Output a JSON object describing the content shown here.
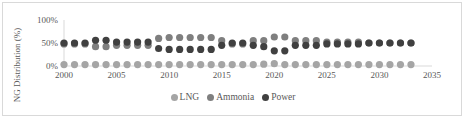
{
  "chart_data": {
    "type": "scatter",
    "title": "",
    "xlabel": "",
    "ylabel": "NG Distribution (%)",
    "xlim": [
      2000,
      2035
    ],
    "ylim": [
      0,
      100
    ],
    "x_ticks": [
      "2000",
      "2005",
      "2010",
      "2015",
      "2020",
      "2025",
      "2030",
      "2035"
    ],
    "y_ticks": [
      "0%",
      "50%",
      "100%"
    ],
    "grid": false,
    "legend_position": "bottom",
    "x": [
      2000,
      2001,
      2002,
      2003,
      2004,
      2005,
      2006,
      2007,
      2008,
      2009,
      2010,
      2011,
      2012,
      2013,
      2014,
      2015,
      2016,
      2017,
      2018,
      2019,
      2020,
      2021,
      2022,
      2023,
      2024,
      2025,
      2026,
      2027,
      2028,
      2029,
      2030,
      2031,
      2032,
      2033
    ],
    "series": [
      {
        "name": "LNG",
        "color": "#a5a5a5",
        "values": [
          3,
          3,
          3,
          3,
          3,
          3,
          3,
          3,
          3,
          3,
          3,
          3,
          3,
          3,
          3,
          3,
          3,
          3,
          3,
          4,
          5,
          3,
          3,
          3,
          3,
          3,
          3,
          3,
          3,
          3,
          3,
          3,
          3,
          3
        ]
      },
      {
        "name": "Ammonia",
        "color": "#7f7f7f",
        "values": [
          48,
          48,
          48,
          42,
          42,
          45,
          45,
          45,
          45,
          60,
          62,
          62,
          62,
          62,
          62,
          55,
          48,
          48,
          55,
          55,
          63,
          63,
          55,
          55,
          55,
          52,
          52,
          52,
          52,
          50,
          50,
          50,
          50,
          50
        ]
      },
      {
        "name": "Power",
        "color": "#404040",
        "values": [
          50,
          50,
          50,
          56,
          56,
          52,
          52,
          52,
          52,
          38,
          36,
          36,
          36,
          36,
          36,
          45,
          50,
          50,
          45,
          42,
          33,
          33,
          45,
          45,
          45,
          48,
          48,
          48,
          48,
          50,
          50,
          50,
          50,
          50
        ]
      }
    ]
  },
  "legend": {
    "items": [
      {
        "label": "LNG",
        "color": "#a5a5a5"
      },
      {
        "label": "Ammonia",
        "color": "#7f7f7f"
      },
      {
        "label": "Power",
        "color": "#404040"
      }
    ]
  }
}
